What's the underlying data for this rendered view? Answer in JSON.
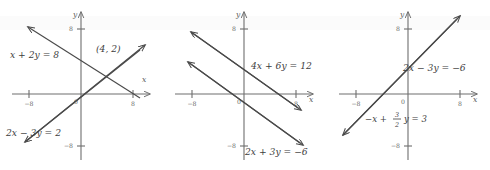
{
  "figure": {
    "background_color": "#ffffff",
    "line_color": "#4a4a4a",
    "axis_color": "#6e6e6e",
    "panel_count": 3
  },
  "axes": {
    "x_label": "x",
    "y_label": "y",
    "origin_label": "0",
    "x_tick_left": "−8",
    "x_tick_right": "8",
    "y_tick_top": "8",
    "y_tick_bottom": "−8",
    "x_range": [
      -10,
      10
    ],
    "y_range": [
      -10,
      10
    ],
    "grid": false
  },
  "panels": [
    {
      "id": "panel-1",
      "name": "intersecting-lines",
      "system_type": "one-solution",
      "intersection_label": "(4, 2)",
      "intersection_point": [
        4,
        2
      ],
      "equations": [
        {
          "label": "x + 2y = 8",
          "placement": "upper-left",
          "slope": -0.5,
          "y_intercept": 4,
          "x_intercept": 8
        },
        {
          "label": "2x − 3y = 2",
          "placement": "lower-left",
          "slope": 0.6667,
          "y_intercept": -0.6667,
          "x_intercept": 1
        }
      ]
    },
    {
      "id": "panel-2",
      "name": "parallel-lines",
      "system_type": "no-solution",
      "intersection_label": "",
      "equations": [
        {
          "label": "4x + 6y = 12",
          "placement": "right-upper",
          "slope": -0.6667,
          "y_intercept": 2,
          "x_intercept": 3
        },
        {
          "label": "2x + 3y = −6",
          "placement": "bottom",
          "slope": -0.6667,
          "y_intercept": -2,
          "x_intercept": -3
        }
      ]
    },
    {
      "id": "panel-3",
      "name": "coincident-lines",
      "system_type": "infinitely-many-solutions",
      "intersection_label": "",
      "equations": [
        {
          "label": "2x − 3y = −6",
          "placement": "right-upper",
          "slope": 0.6667,
          "y_intercept": 2,
          "x_intercept": -3
        },
        {
          "label_parts": {
            "prefix": "−x +",
            "numerator": "3",
            "denominator": "2",
            "suffix": "y = 3"
          },
          "label": "−x + 3/2 y = 3",
          "placement": "lower-left",
          "slope": 0.6667,
          "y_intercept": 2,
          "x_intercept": -3
        }
      ]
    }
  ]
}
